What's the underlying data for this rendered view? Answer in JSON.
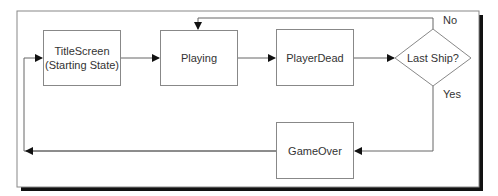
{
  "diagram": {
    "type": "state-flowchart",
    "nodes": [
      {
        "id": "title",
        "label": "TitleScreen\n(Starting State)",
        "line1": "TitleScreen",
        "line2": "(Starting State)",
        "shape": "rect"
      },
      {
        "id": "playing",
        "label": "Playing",
        "shape": "rect"
      },
      {
        "id": "dead",
        "label": "PlayerDead",
        "shape": "rect"
      },
      {
        "id": "decision",
        "label": "Last Ship?",
        "shape": "diamond"
      },
      {
        "id": "gameover",
        "label": "GameOver",
        "shape": "rect"
      }
    ],
    "edges": [
      {
        "from": "title",
        "to": "playing",
        "label": ""
      },
      {
        "from": "playing",
        "to": "dead",
        "label": ""
      },
      {
        "from": "dead",
        "to": "decision",
        "label": ""
      },
      {
        "from": "decision",
        "to": "playing",
        "label": "No"
      },
      {
        "from": "decision",
        "to": "gameover",
        "label": "Yes"
      },
      {
        "from": "gameover",
        "to": "title",
        "label": ""
      }
    ],
    "edge_labels": {
      "no": "No",
      "yes": "Yes"
    }
  }
}
